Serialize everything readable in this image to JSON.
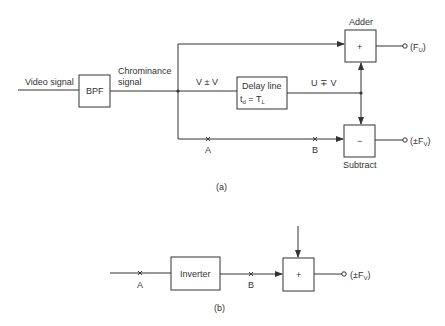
{
  "part_a": {
    "input_label": "Video signal",
    "bpf_label": "BPF",
    "chroma_label_line1": "Chrominance",
    "chroma_label_line2": "signal",
    "v_pm_v": "V ± V",
    "delay_line_label": "Delay line",
    "delay_t": "t",
    "delay_sub_d": "d",
    "delay_eq": " = T",
    "delay_sub_l": "L",
    "u_mp_v": "U ∓ V",
    "adder_label": "Adder",
    "adder_sign": "+",
    "subtract_label": "Subtract",
    "subtract_sign": "−",
    "out_fu_open": "(F",
    "out_fu_sub": "U",
    "out_fu_close": ")",
    "out_fv_open": "(±F",
    "out_fv_sub": "V",
    "out_fv_close": ")",
    "point_a": "A",
    "point_b": "B",
    "caption": "(a)"
  },
  "part_b": {
    "inverter_label": "Inverter",
    "adder_sign": "+",
    "point_a": "A",
    "point_b": "B",
    "out_open": "(±F",
    "out_sub": "V",
    "out_close": ")",
    "caption": "(b)"
  },
  "colors": {
    "stroke": "#333333",
    "background": "#ffffff"
  }
}
